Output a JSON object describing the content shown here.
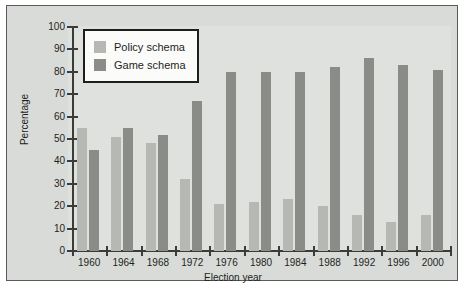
{
  "chart_data": {
    "type": "bar",
    "title": "",
    "xlabel": "Election year",
    "ylabel": "Percentage",
    "categories": [
      "1960",
      "1964",
      "1968",
      "1972",
      "1976",
      "1980",
      "1984",
      "1988",
      "1992",
      "1996",
      "2000"
    ],
    "ylim": [
      0,
      100
    ],
    "yticks": [
      0,
      10,
      20,
      30,
      40,
      50,
      60,
      70,
      80,
      90,
      100
    ],
    "grid": false,
    "legend_position": "upper left",
    "series": [
      {
        "name": "Policy schema",
        "color": "#b6b8b4",
        "values": [
          55,
          51,
          48,
          32,
          21,
          22,
          23,
          20,
          16,
          13,
          16
        ]
      },
      {
        "name": "Game schema",
        "color": "#8a8c88",
        "values": [
          45,
          55,
          52,
          67,
          80,
          80,
          80,
          82,
          86,
          83,
          81
        ]
      }
    ]
  },
  "figure": {
    "panel_background": "#d9dbd8",
    "plot_background": "#dfe1de",
    "axis_color": "#3a3c3a",
    "text_color": "#1d1f1d",
    "legend_background": "#fbfbfa",
    "legend_border": "#1d1f1d"
  }
}
